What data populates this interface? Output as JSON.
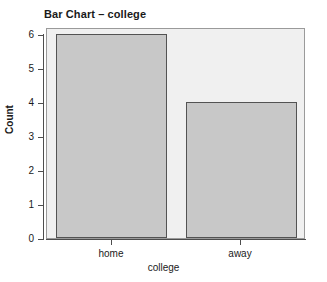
{
  "chart_data": {
    "type": "bar",
    "title": "Bar Chart – college",
    "xlabel": "college",
    "ylabel": "Count",
    "categories": [
      "home",
      "away"
    ],
    "values": [
      6,
      4
    ],
    "ylim": [
      0,
      6
    ],
    "yticks": [
      0,
      1,
      2,
      3,
      4,
      5,
      6
    ],
    "ytick_labels": [
      "0",
      "1",
      "2",
      "3",
      "4",
      "5",
      "6"
    ],
    "grid": false,
    "legend": false,
    "legend_position": "none",
    "colors": {
      "bar_fill": "#c8c8c8",
      "bar_border": "#535353",
      "panel_background": "#f0f0f0",
      "panel_border": "#9a9a9a",
      "axis_line": "#4d4d4d",
      "text": "#1a1a1a",
      "figure_background": "#ffffff"
    }
  }
}
